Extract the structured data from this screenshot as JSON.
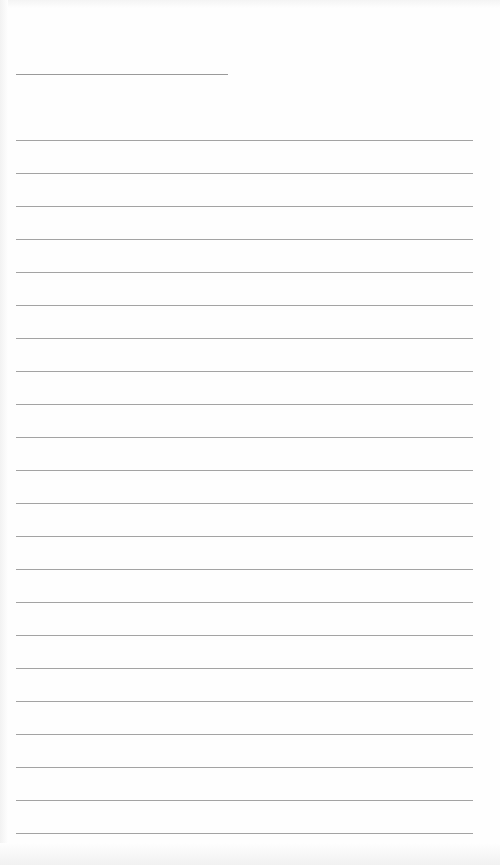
{
  "document": {
    "type": "lined-paper",
    "title_line": {
      "text": ""
    },
    "ruled_lines": {
      "count": 22,
      "first_y": 140,
      "spacing": 33,
      "lines": [
        "",
        "",
        "",
        "",
        "",
        "",
        "",
        "",
        "",
        "",
        "",
        "",
        "",
        "",
        "",
        "",
        "",
        "",
        "",
        "",
        "",
        ""
      ]
    },
    "colors": {
      "paper": "#fefefe",
      "rule": "#a3a3a3"
    }
  }
}
